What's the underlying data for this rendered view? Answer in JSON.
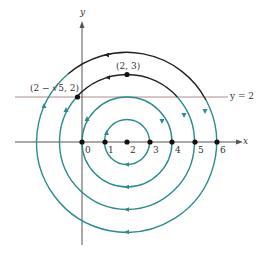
{
  "figure": {
    "axes": {
      "x_label": "x",
      "y_label": "y"
    },
    "tick_labels": [
      "0",
      "1",
      "2",
      "3",
      "4",
      "5",
      "6"
    ],
    "horizontal_line_label": "y = 2",
    "point_labels": {
      "top_point": "(2, 3)",
      "intersection_point": "(2 − √5, 2)"
    },
    "colors": {
      "teal": "#2a8c8c",
      "black": "#222222",
      "axis": "#555555",
      "line_y2": "#b08a8a"
    },
    "center": [
      2,
      0
    ],
    "radii": [
      1,
      2,
      3,
      4
    ],
    "marked_points": [
      [
        0,
        0
      ],
      [
        1,
        0
      ],
      [
        2,
        0
      ],
      [
        3,
        0
      ],
      [
        4,
        0
      ],
      [
        5,
        0
      ],
      [
        6,
        0
      ],
      [
        2,
        3
      ],
      [
        -0.236,
        2
      ]
    ]
  }
}
